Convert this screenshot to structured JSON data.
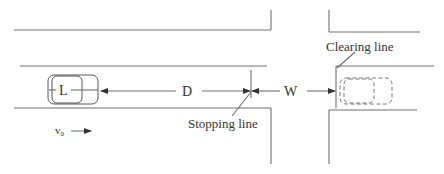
{
  "diagram": {
    "type": "intersection-dilemma-zone",
    "labels": {
      "vehicle_length": "L",
      "stopping_distance": "D",
      "intersection_width": "W",
      "stopping_line": "Stopping line",
      "clearing_line": "Clearing line",
      "velocity": "v",
      "velocity_subscript": "0"
    },
    "colors": {
      "line": "#6e6e6e",
      "text": "#333333",
      "background": "#ffffff"
    }
  }
}
